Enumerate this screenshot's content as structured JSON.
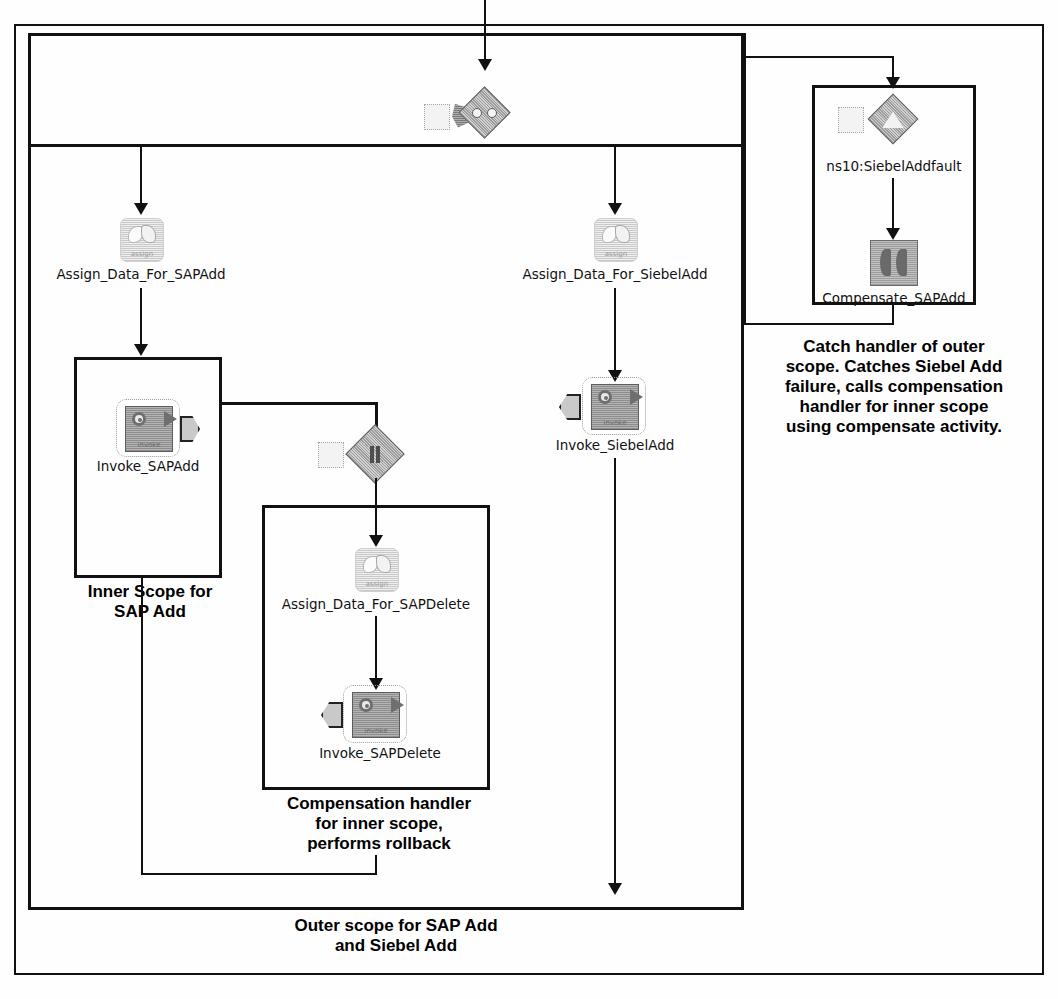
{
  "diagram": {
    "type": "bpel-process-flow",
    "nodes": {
      "flow_gateway": {
        "label": "",
        "icon": "flow-diamond-icon"
      },
      "assign_sap_add": {
        "label": "Assign_Data_For_SAPAdd",
        "icon": "assign-icon"
      },
      "invoke_sap_add": {
        "label": "Invoke_SAPAdd",
        "icon": "invoke-icon"
      },
      "assign_siebel_add": {
        "label": "Assign_Data_For_SiebelAdd",
        "icon": "assign-icon"
      },
      "invoke_siebel_add": {
        "label": "Invoke_SiebelAdd",
        "icon": "invoke-icon"
      },
      "compensation_gateway": {
        "label": "",
        "icon": "compensation-diamond-icon"
      },
      "assign_sap_delete": {
        "label": "Assign_Data_For_SAPDelete",
        "icon": "assign-icon"
      },
      "invoke_sap_delete": {
        "label": "Invoke_SAPDelete",
        "icon": "invoke-icon"
      },
      "catch_fault": {
        "label": "ns10:SiebelAddfault",
        "icon": "fault-diamond-icon"
      },
      "compensate_sap_add": {
        "label": "Compensate_SAPAdd",
        "icon": "compensate-icon"
      }
    },
    "captions": {
      "inner_scope": "Inner Scope for\nSAP Add",
      "inner_scope_l1": "Inner Scope for",
      "inner_scope_l2": "SAP Add",
      "compensation_handler_l1": "Compensation handler",
      "compensation_handler_l2": "for inner scope,",
      "compensation_handler_l3": "performs rollback",
      "outer_scope_l1": "Outer scope for SAP Add",
      "outer_scope_l2": "and Siebel Add",
      "catch_handler_l1": "Catch handler of outer",
      "catch_handler_l2": "scope. Catches Siebel Add",
      "catch_handler_l3": "failure, calls compensation",
      "catch_handler_l4": "handler for inner scope",
      "catch_handler_l5": "using compensate activity."
    },
    "colors": {
      "stroke": "#111111",
      "icon_gray": "#a0a0a0",
      "icon_light": "#dcdcdc",
      "background": "#ffffff"
    }
  }
}
